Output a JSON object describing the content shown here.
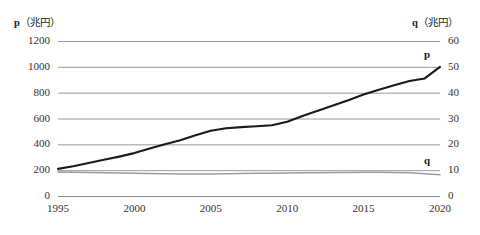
{
  "chart_data": {
    "type": "line",
    "title": "",
    "xlabel": "",
    "ylabel": "p（兆円）",
    "y2label": "q（兆円）",
    "axis_titles": {
      "left_symbol": "p",
      "left_unit": "（兆円）",
      "right_symbol": "q",
      "right_unit": "（兆円）"
    },
    "x": [
      1995,
      1996,
      1997,
      1998,
      1999,
      2000,
      2001,
      2002,
      2003,
      2004,
      2005,
      2006,
      2007,
      2008,
      2009,
      2010,
      2011,
      2012,
      2013,
      2014,
      2015,
      2016,
      2017,
      2018,
      2019,
      2020
    ],
    "xticks": [
      1995,
      2000,
      2005,
      2010,
      2015,
      2020
    ],
    "xtick_labels": [
      "1995",
      "2000",
      "2005",
      "2010",
      "2015",
      "2020"
    ],
    "xlim": [
      1995,
      2020
    ],
    "yticks": [
      0,
      200,
      400,
      600,
      800,
      1000,
      1200
    ],
    "ytick_labels": [
      "0",
      "200",
      "400",
      "600",
      "800",
      "1000",
      "1200"
    ],
    "ylim": [
      0,
      1200
    ],
    "y2ticks": [
      0,
      10,
      20,
      30,
      40,
      50,
      60
    ],
    "y2tick_labels": [
      "0",
      "10",
      "20",
      "30",
      "40",
      "50",
      "60"
    ],
    "y2lim": [
      0,
      60
    ],
    "grid": true,
    "grid_color": "#8d8d8d",
    "legend_position": "inline-end-of-line",
    "series": [
      {
        "name": "p",
        "label": "p",
        "axis": "left",
        "color": "#1a1a1a",
        "width": 2.1,
        "values": [
          210,
          230,
          255,
          280,
          305,
          332,
          368,
          400,
          432,
          470,
          505,
          525,
          533,
          540,
          548,
          575,
          620,
          660,
          700,
          742,
          785,
          822,
          858,
          890,
          910,
          1000
        ]
      },
      {
        "name": "q",
        "label": "q",
        "axis": "right",
        "color": "#9a9a9a",
        "width": 1.6,
        "values": [
          9.3,
          9.2,
          9.1,
          9.0,
          8.9,
          8.8,
          8.7,
          8.6,
          8.5,
          8.5,
          8.5,
          8.6,
          8.7,
          8.8,
          8.8,
          8.9,
          9.0,
          9.0,
          9.1,
          9.1,
          9.2,
          9.2,
          9.1,
          9.0,
          8.6,
          8.2
        ]
      }
    ]
  },
  "annotations": {
    "p_label": "p",
    "q_label": "q"
  }
}
